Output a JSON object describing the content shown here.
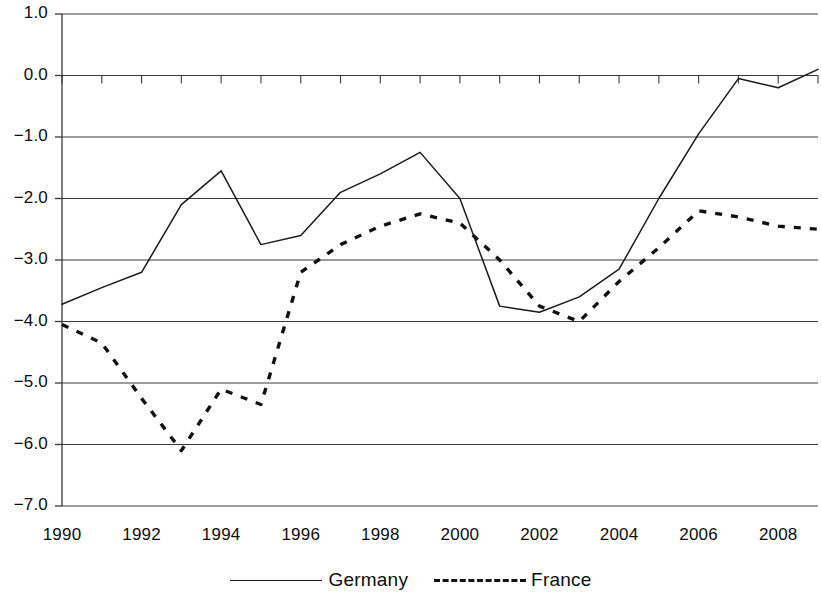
{
  "chart_data": {
    "type": "line",
    "title": "",
    "subtitle": "",
    "xlabel": "",
    "ylabel": "",
    "x": [
      1990,
      1991,
      1992,
      1993,
      1994,
      1995,
      1996,
      1997,
      1998,
      1999,
      2000,
      2001,
      2002,
      2003,
      2004,
      2005,
      2006,
      2007,
      2008,
      2009
    ],
    "xlim": [
      1990,
      2009
    ],
    "ylim": [
      -7.0,
      1.0
    ],
    "grid": true,
    "grid_axis": "y",
    "legend_position": "bottom",
    "xticks": [
      1990,
      1992,
      1994,
      1996,
      1998,
      2000,
      2002,
      2004,
      2006,
      2008
    ],
    "xtick_labels": [
      "1990",
      "1992",
      "1994",
      "1996",
      "1998",
      "2000",
      "2002",
      "2004",
      "2006",
      "2008"
    ],
    "yticks": [
      1.0,
      0.0,
      -1.0,
      -2.0,
      -3.0,
      -4.0,
      -5.0,
      -6.0,
      -7.0
    ],
    "ytick_labels": [
      "1.0",
      "0.0",
      "−1.0",
      "−2.0",
      "−3.0",
      "−4.0",
      "−5.0",
      "−6.0",
      "−7.0"
    ],
    "series": [
      {
        "name": "Germany",
        "style": "solid",
        "color": "#1a1a1a",
        "values": [
          -3.72,
          -3.45,
          -3.2,
          -2.1,
          -1.55,
          -2.75,
          -2.6,
          -1.9,
          -1.6,
          -1.25,
          -2.0,
          -3.75,
          -3.85,
          -3.6,
          -3.15,
          -2.0,
          -0.95,
          -0.05,
          -0.2,
          0.1
        ]
      },
      {
        "name": "France",
        "style": "dashed",
        "color": "#111111",
        "values": [
          -4.05,
          -4.35,
          -5.25,
          -6.1,
          -5.1,
          -5.35,
          -3.2,
          -2.75,
          -2.45,
          -2.25,
          -2.4,
          -3.0,
          -3.75,
          -4.0,
          -3.35,
          -2.8,
          -2.2,
          -2.3,
          -2.45,
          -2.5
        ]
      }
    ]
  },
  "legend": {
    "entries": [
      {
        "label": "Germany",
        "style": "solid"
      },
      {
        "label": "France",
        "style": "dashed"
      }
    ]
  }
}
